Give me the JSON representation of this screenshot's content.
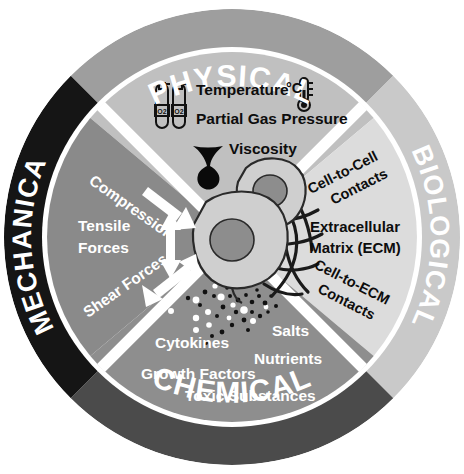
{
  "diagram": {
    "center_illustration": {
      "name": "two-cells-with-ecm",
      "cells": 2,
      "nuclei": 2,
      "ecm_fibers": true,
      "molecule_particles": true
    }
  },
  "rings": [
    {
      "id": "physical",
      "label": "PHYSICAL",
      "position": "top",
      "ring_color": "#9e9e9e",
      "wedge_color": "#c0c0c0",
      "text_color": "#ffffff"
    },
    {
      "id": "biological",
      "label": "BIOLOGICAL",
      "position": "right",
      "ring_color": "#c9c9c9",
      "wedge_color": "#dcdcdc",
      "text_color": "#ffffff"
    },
    {
      "id": "chemical",
      "label": "CHEMICAL",
      "position": "bottom",
      "ring_color": "#4b4b4b",
      "wedge_color": "#8e8e8e",
      "text_color": "#ffffff"
    },
    {
      "id": "mechanical",
      "label": "MECHANICAL",
      "position": "left",
      "ring_color": "#151515",
      "wedge_color": "#8a8a8a",
      "text_color": "#ffffff"
    }
  ],
  "physical": {
    "heading": "PHYSICAL",
    "items": [
      {
        "label": "Temperature",
        "icon": "thermometer-icon",
        "icon_text": "°C"
      },
      {
        "label": "Partial Gas Pressure",
        "icon": "gas-cylinder-icon",
        "icon_text": "O2"
      },
      {
        "label": "Viscosity",
        "icon": "viscous-drop-icon",
        "icon_text": ""
      }
    ]
  },
  "biological": {
    "heading": "BIOLOGICAL",
    "items": [
      {
        "label": "Cell-to-Cell\nContacts",
        "line1": "Cell-to-Cell",
        "line2": "Contacts"
      },
      {
        "label": "Extracellular Matrix (ECM)",
        "line1": "Extracellular",
        "line2": "Matrix (ECM)"
      },
      {
        "label": "Cell-to-ECM\nContacts",
        "line1": "Cell-to-ECM",
        "line2": "Contacts"
      }
    ]
  },
  "mechanical": {
    "heading": "MECHANICAL",
    "items": [
      {
        "label": "Compression",
        "arrow": "single-arrow-down-right"
      },
      {
        "line1": "Tensile",
        "line2": "Forces",
        "label": "Tensile Forces",
        "arrow": "double-arrow-vertical"
      },
      {
        "label": "Shear Forces",
        "arrow": "double-arrow-diagonal"
      }
    ]
  },
  "chemical": {
    "heading": "CHEMICAL",
    "items": [
      {
        "label": "Cytokines"
      },
      {
        "label": "Salts"
      },
      {
        "label": "Nutrients"
      },
      {
        "label": "Growth Factors"
      },
      {
        "label": "Toxic Substances"
      }
    ]
  },
  "icons": {
    "gas_cylinder": "gas-cylinder-icon",
    "thermometer": "thermometer-icon",
    "viscous_drop": "viscous-drop-icon",
    "cell": "cell-icon",
    "ecm_fiber": "ecm-fiber-icon",
    "particles": "molecule-particles-icon"
  },
  "colors": {
    "white": "#ffffff",
    "black": "#000000",
    "ring_physical": "#9e9e9e",
    "ring_biological": "#c9c9c9",
    "ring_chemical": "#4b4b4b",
    "ring_mechanical": "#151515",
    "wedge_physical": "#c0c0c0",
    "wedge_biological": "#dcdcdc",
    "wedge_chemical": "#8e8e8e",
    "wedge_mechanical": "#8a8a8a",
    "cell_body": "#cfcfcf",
    "cell_nucleus": "#8d8d8d"
  }
}
